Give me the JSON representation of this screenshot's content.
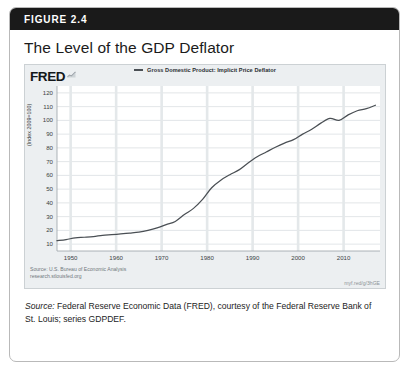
{
  "figure": {
    "label": "FIGURE 2.4",
    "title": "The Level of the GDP Deflator",
    "caption_lead": "Source:",
    "caption_body": " Federal Reserve Economic Data (FRED), courtesy of the Federal Reserve Bank of St. Louis; series GDPDEF."
  },
  "fred": {
    "wordmark": "FRED",
    "spark_icon": "sparkline-icon",
    "source_note": "Source: U.S. Bureau of Economic Analysis",
    "url": "research.stlouisfed.org",
    "shortlink": "myf.red/g/3hGE"
  },
  "colors": {
    "header_bar": "#1a1a1a",
    "panel_bg": "#eceff1",
    "plot_bg": "#ffffff",
    "line": "#4a4f54",
    "gridline_h": "#d6dade",
    "gridline_v": "#e4e8ea",
    "card_border": "#b9b9b9"
  },
  "chart_data": {
    "type": "line",
    "title": "The Level of the GDP Deflator",
    "legend": [
      "Gross Domestic Product: Implicit Price Deflator"
    ],
    "legend_position": "top-center",
    "xlabel": "",
    "ylabel": "(Index 2009=100)",
    "xlim": [
      1947,
      2018
    ],
    "ylim": [
      5,
      125
    ],
    "yticks": [
      10,
      20,
      30,
      40,
      50,
      60,
      70,
      80,
      90,
      100,
      110,
      120
    ],
    "xticks": [
      1950,
      1960,
      1970,
      1980,
      1990,
      2000,
      2010
    ],
    "grid": true,
    "series": [
      {
        "name": "Gross Domestic Product: Implicit Price Deflator",
        "x": [
          1947,
          1949,
          1951,
          1953,
          1955,
          1957,
          1959,
          1961,
          1963,
          1965,
          1967,
          1969,
          1971,
          1973,
          1975,
          1977,
          1979,
          1981,
          1983,
          1985,
          1987,
          1989,
          1991,
          1993,
          1995,
          1997,
          1999,
          2001,
          2003,
          2005,
          2007,
          2009,
          2011,
          2013,
          2015,
          2017
        ],
        "values": [
          12.5,
          13.3,
          14.6,
          15.0,
          15.5,
          16.4,
          16.9,
          17.4,
          18.0,
          18.7,
          20.0,
          21.8,
          24.2,
          26.5,
          31.5,
          36.0,
          42.5,
          51.0,
          56.5,
          60.5,
          64.0,
          69.0,
          73.5,
          77.0,
          80.5,
          83.5,
          86.0,
          90.0,
          93.5,
          98.0,
          101.5,
          100.0,
          104.0,
          107.0,
          108.5,
          111.0
        ]
      }
    ]
  }
}
